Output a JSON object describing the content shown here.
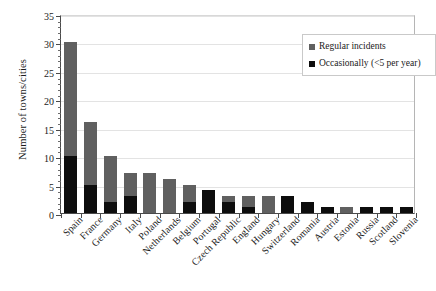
{
  "chart_data": {
    "type": "bar",
    "subtype": "stacked-vertical-bar",
    "title": "",
    "xlabel": "",
    "ylabel": "Number of towns/cities",
    "ylim": [
      0,
      35
    ],
    "ytick_step": 5,
    "yticks": [
      0,
      5,
      10,
      15,
      20,
      25,
      30,
      35
    ],
    "grid": "horizontal",
    "legend_position": "top-right-inside",
    "categories": [
      "Spain",
      "France",
      "Germany",
      "Italy",
      "Poland",
      "Netherlands",
      "Belgium",
      "Portugal",
      "Czech Republic",
      "England",
      "Hungary",
      "Switzerland",
      "Romania",
      "Austria",
      "Estonia",
      "Russia",
      "Scotland",
      "Slovenia"
    ],
    "series": [
      {
        "name": "Occasionally (<5 per year)",
        "color": "#0d0d0d",
        "values": [
          10,
          5,
          2,
          3,
          0,
          0,
          2,
          4,
          2,
          1,
          0,
          3,
          2,
          1,
          0,
          1,
          1,
          1
        ]
      },
      {
        "name": "Regular incidents",
        "color": "#606060",
        "values": [
          20,
          11,
          8,
          4,
          7,
          6,
          3,
          0,
          1,
          2,
          3,
          0,
          0,
          0,
          1,
          0,
          0,
          0
        ]
      }
    ],
    "totals": [
      30,
      16,
      10,
      7,
      7,
      6,
      5,
      4,
      3,
      3,
      3,
      3,
      2,
      1,
      1,
      1,
      1,
      1
    ]
  },
  "legend": {
    "items": [
      {
        "label": "Regular incidents",
        "swatch": "#606060"
      },
      {
        "label": "Occasionally (<5 per year)",
        "swatch": "#0d0d0d"
      }
    ]
  },
  "axes": {
    "y_title": "Number of towns/cities",
    "y_labels": [
      "0",
      "5",
      "10",
      "15",
      "20",
      "25",
      "30",
      "35"
    ]
  }
}
